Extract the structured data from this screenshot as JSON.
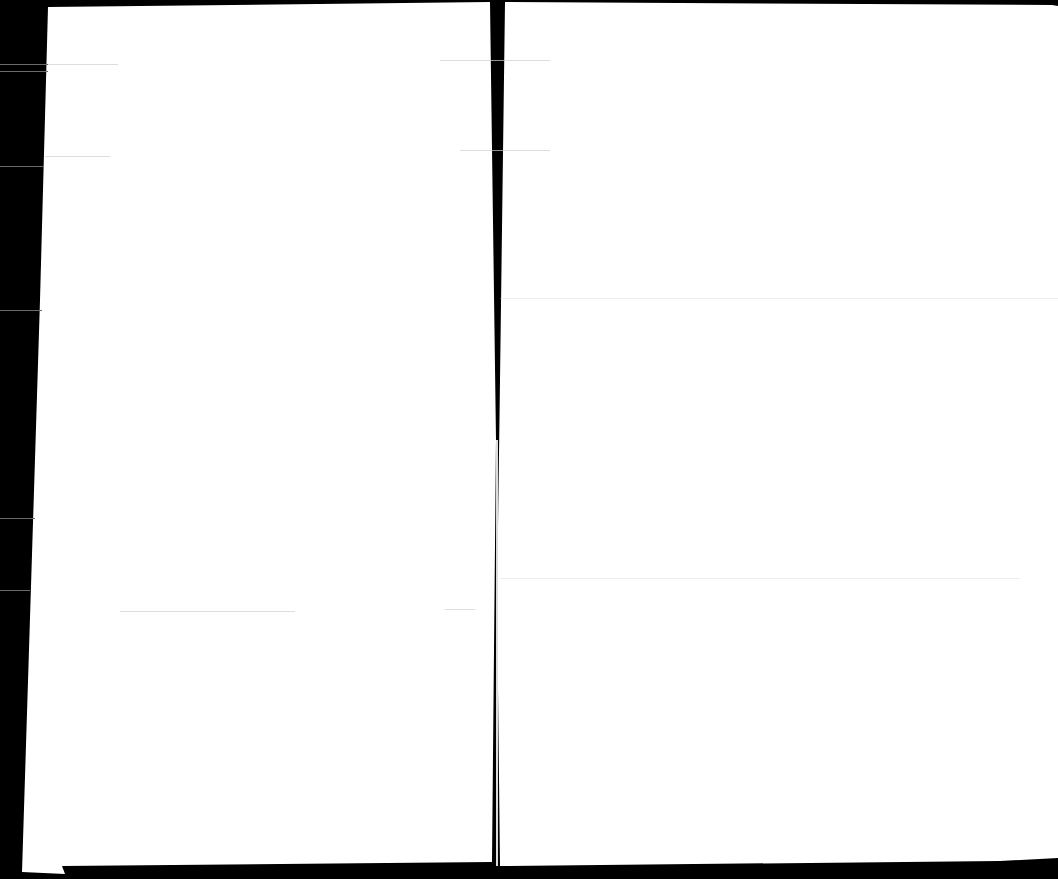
{
  "document": {
    "type": "scanned-spread",
    "pages": [
      {
        "side": "left",
        "content": ""
      },
      {
        "side": "right",
        "content": ""
      }
    ],
    "colors": {
      "background": "#000000",
      "paper": "#ffffff",
      "streak": "#cfcfcf"
    }
  }
}
